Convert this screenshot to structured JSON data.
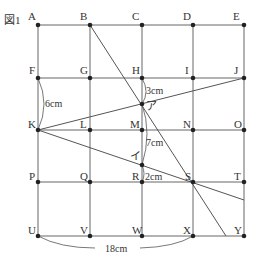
{
  "figure": {
    "title": "図1",
    "point_labels": [
      "A",
      "B",
      "C",
      "D",
      "E",
      "F",
      "G",
      "H",
      "I",
      "J",
      "K",
      "L",
      "M",
      "N",
      "O",
      "P",
      "Q",
      "R",
      "S",
      "T",
      "U",
      "V",
      "W",
      "X",
      "Y"
    ],
    "intersection_labels": {
      "a": "ア",
      "i": "イ"
    },
    "dimensions": {
      "fk": "6cm",
      "h_a": "3cm",
      "a_i": "7cm",
      "i_r": "2cm",
      "ux": "18cm"
    },
    "colors": {
      "line": "#555555",
      "dot": "#222222",
      "text": "#333333"
    }
  }
}
